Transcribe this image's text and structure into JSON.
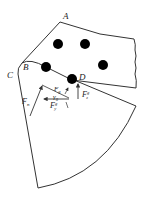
{
  "diagram": {
    "type": "mechanics free-body diagram",
    "stroke_color": "#333333",
    "dot_color": "#000000",
    "points": {
      "A": {
        "label": "A"
      },
      "B": {
        "label": "B"
      },
      "C": {
        "label": "C"
      },
      "D": {
        "label": "D"
      }
    },
    "forces": {
      "Fn": {
        "main": "F",
        "sub": "n"
      },
      "Fg": {
        "main": "F",
        "sub": "g"
      },
      "Fz": {
        "main": "F",
        "sup": "g",
        "sub": "z"
      },
      "Fy": {
        "main": "F",
        "sup": "g",
        "sub": "y"
      }
    },
    "angle": {
      "main": "γ",
      "sub": "0"
    },
    "dots_count": 5
  }
}
